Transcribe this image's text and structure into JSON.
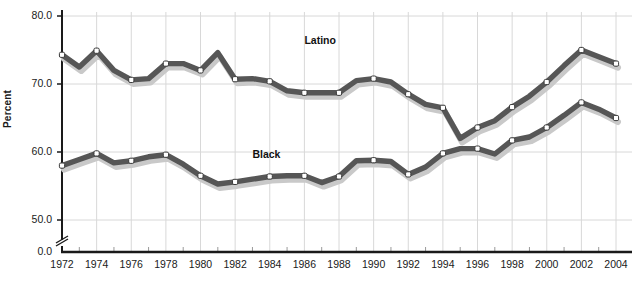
{
  "chart_data": {
    "type": "line",
    "title": "",
    "xlabel": "",
    "ylabel": "Percent",
    "ylim": [
      50.0,
      80.0
    ],
    "xlim": [
      1972,
      2004
    ],
    "grid": true,
    "axis_break": true,
    "legend": "inline-labels",
    "y_ticks": [
      "80.0",
      "70.0",
      "60.0",
      "50.0",
      "0.0"
    ],
    "x_ticks": [
      "1972",
      "1974",
      "1976",
      "1978",
      "1980",
      "1982",
      "1984",
      "1986",
      "1988",
      "1990",
      "1992",
      "1994",
      "1996",
      "1998",
      "2000",
      "2002",
      "2004"
    ],
    "x": [
      1972,
      1973,
      1974,
      1975,
      1976,
      1977,
      1978,
      1979,
      1980,
      1981,
      1982,
      1983,
      1984,
      1985,
      1986,
      1987,
      1988,
      1989,
      1990,
      1991,
      1992,
      1993,
      1994,
      1995,
      1996,
      1997,
      1998,
      1999,
      2000,
      2001,
      2002,
      2003,
      2004
    ],
    "series": [
      {
        "name": "Latino",
        "color": "#565656",
        "values": [
          74.3,
          72.5,
          74.9,
          72.0,
          70.6,
          70.8,
          73.0,
          73.0,
          72.0,
          74.6,
          70.7,
          70.8,
          70.4,
          69.0,
          68.7,
          68.7,
          68.7,
          70.5,
          70.8,
          70.3,
          68.5,
          67.0,
          66.5,
          62.0,
          63.6,
          64.6,
          66.6,
          68.2,
          70.3,
          72.7,
          75.0,
          74.0,
          73.0
        ]
      },
      {
        "name": "Black",
        "color": "#565656",
        "values": [
          58.0,
          58.9,
          59.8,
          58.4,
          58.7,
          59.3,
          59.6,
          58.2,
          56.5,
          55.3,
          55.6,
          56.0,
          56.4,
          56.5,
          56.5,
          55.5,
          56.4,
          58.7,
          58.8,
          58.6,
          56.7,
          57.8,
          59.8,
          60.5,
          60.5,
          59.7,
          61.7,
          62.2,
          63.6,
          65.4,
          67.3,
          66.3,
          65.0
        ]
      }
    ],
    "annotations": [
      {
        "text": "Latino",
        "x": 1986,
        "y": 76.3
      },
      {
        "text": "Black",
        "x": 1983,
        "y": 59.6
      }
    ]
  }
}
